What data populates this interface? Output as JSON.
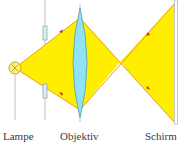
{
  "diagram": {
    "type": "optical-projection",
    "labels": {
      "lamp": "Lampe",
      "objective": "Objektiv",
      "screen": "Schirm"
    },
    "colors": {
      "light_fill": "#ffee00",
      "ray_edge": "#e8a020",
      "arrow": "#d03020",
      "lens_fill": "#8fe3f5",
      "lens_stroke": "#5a9aaa",
      "lamp_fill": "#fff27a",
      "lamp_stroke": "#c8a020",
      "line_gray": "#b8b8b8",
      "aperture_fill": "#d8eef4",
      "aperture_stroke": "#9aa8b0"
    }
  }
}
